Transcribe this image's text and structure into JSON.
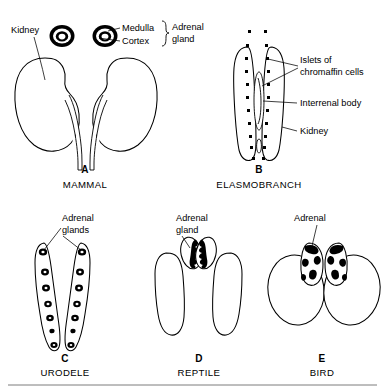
{
  "figure": {
    "panels": [
      {
        "letter": "A",
        "caption": "MAMMAL",
        "labels": [
          {
            "name": "kidney",
            "text": "Kidney"
          },
          {
            "name": "medulla",
            "text": "Medulla"
          },
          {
            "name": "cortex",
            "text": "Cortex"
          },
          {
            "name": "adrenal-gland",
            "text": "Adrenal"
          },
          {
            "name": "adrenal-gland-line2",
            "text": "gland"
          }
        ]
      },
      {
        "letter": "B",
        "caption": "ELASMOBRANCH",
        "labels": [
          {
            "name": "islets-line1",
            "text": "Islets of"
          },
          {
            "name": "islets-line2",
            "text": "chromaffin cells"
          },
          {
            "name": "interrenal-body",
            "text": "Interrenal body"
          },
          {
            "name": "kidney",
            "text": "Kidney"
          }
        ]
      },
      {
        "letter": "C",
        "caption": "URODELE",
        "labels": [
          {
            "name": "adrenal-glands-line1",
            "text": "Adrenal"
          },
          {
            "name": "adrenal-glands-line2",
            "text": "glands"
          }
        ]
      },
      {
        "letter": "D",
        "caption": "REPTILE",
        "labels": [
          {
            "name": "adrenal-gland-line1",
            "text": "Adrenal"
          },
          {
            "name": "adrenal-gland-line2",
            "text": "gland"
          }
        ]
      },
      {
        "letter": "E",
        "caption": "BIRD",
        "labels": [
          {
            "name": "adrenal",
            "text": "Adrenal"
          }
        ]
      }
    ],
    "colors": {
      "ink": "#000000",
      "background": "#ffffff",
      "rule": "#7d7d7d"
    }
  }
}
